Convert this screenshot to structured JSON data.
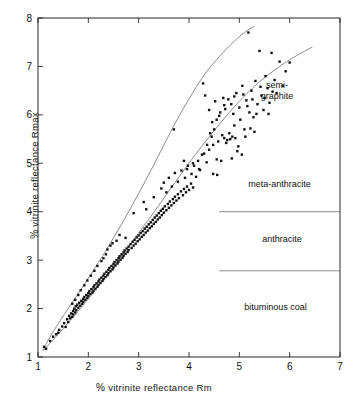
{
  "figure": {
    "background": "#ffffff",
    "ink": "#111111",
    "curve_color": "#6f6f6f"
  },
  "chart_data": {
    "type": "scatter",
    "title": "",
    "xlabel": "% vitrinite reflectance  Rm",
    "ylabel": "% vitrinite reflectance  Rmax",
    "xlim": [
      1,
      7
    ],
    "ylim": [
      1,
      8
    ],
    "xticks": [
      1,
      2,
      3,
      4,
      5,
      6,
      7
    ],
    "yticks": [
      1,
      2,
      3,
      4,
      5,
      6,
      7,
      8
    ],
    "xtick_labels": [
      "1",
      "2",
      "3",
      "4",
      "5",
      "6",
      "7"
    ],
    "ytick_labels": [
      "1",
      "2",
      "3",
      "4",
      "5",
      "6",
      "7",
      "8"
    ],
    "grid": false,
    "legend": false,
    "marker": "filled-square",
    "marker_size_px": 2.4,
    "marker_color": "#111111",
    "boundary_curves": [
      {
        "name": "upper-boundary",
        "points": [
          [
            1.1,
            1.15
          ],
          [
            1.3,
            1.52
          ],
          [
            1.6,
            2.0
          ],
          [
            1.9,
            2.47
          ],
          [
            2.2,
            2.95
          ],
          [
            2.5,
            3.46
          ],
          [
            2.8,
            4.0
          ],
          [
            3.1,
            4.57
          ],
          [
            3.4,
            5.17
          ],
          [
            3.7,
            5.78
          ],
          [
            4.0,
            6.33
          ],
          [
            4.3,
            6.82
          ],
          [
            4.6,
            7.2
          ],
          [
            4.9,
            7.52
          ],
          [
            5.1,
            7.7
          ],
          [
            5.3,
            7.83
          ]
        ]
      },
      {
        "name": "lower-boundary",
        "points": [
          [
            1.1,
            1.13
          ],
          [
            1.4,
            1.47
          ],
          [
            1.8,
            1.95
          ],
          [
            2.2,
            2.46
          ],
          [
            2.6,
            3.0
          ],
          [
            3.0,
            3.56
          ],
          [
            3.4,
            4.13
          ],
          [
            3.8,
            4.72
          ],
          [
            4.2,
            5.28
          ],
          [
            4.6,
            5.8
          ],
          [
            5.0,
            6.28
          ],
          [
            5.4,
            6.68
          ],
          [
            5.8,
            7.0
          ],
          [
            6.1,
            7.2
          ],
          [
            6.45,
            7.4
          ]
        ]
      }
    ],
    "zone_dividers": [
      {
        "name": "meta-anthracite-anthracite-divider",
        "y": 4.0,
        "x_from": 4.6,
        "x_to": 7.0
      },
      {
        "name": "anthracite-bituminous-divider",
        "y": 2.78,
        "x_from": 4.6,
        "x_to": 7.0
      }
    ],
    "zone_labels": [
      {
        "name": "semi-graphite",
        "lines": [
          "semi-",
          "graphite"
        ],
        "x": 5.75,
        "y": 6.55
      },
      {
        "name": "meta-anthracite",
        "lines": [
          "meta-anthracite"
        ],
        "x": 5.8,
        "y": 4.52
      },
      {
        "name": "anthracite",
        "lines": [
          "anthracite"
        ],
        "x": 5.85,
        "y": 3.38
      },
      {
        "name": "bituminous coal",
        "lines": [
          "bituminous coal"
        ],
        "x": 5.72,
        "y": 1.98
      }
    ],
    "points": [
      [
        1.12,
        1.21
      ],
      [
        1.16,
        1.17
      ],
      [
        1.24,
        1.33
      ],
      [
        1.3,
        1.42
      ],
      [
        1.36,
        1.47
      ],
      [
        1.42,
        1.56
      ],
      [
        1.4,
        1.5
      ],
      [
        1.48,
        1.63
      ],
      [
        1.52,
        1.7
      ],
      [
        1.55,
        1.62
      ],
      [
        1.58,
        1.78
      ],
      [
        1.6,
        1.72
      ],
      [
        1.62,
        1.85
      ],
      [
        1.64,
        1.8
      ],
      [
        1.66,
        1.9
      ],
      [
        1.68,
        1.83
      ],
      [
        1.7,
        1.95
      ],
      [
        1.7,
        1.88
      ],
      [
        1.72,
        2.0
      ],
      [
        1.74,
        1.92
      ],
      [
        1.75,
        2.05
      ],
      [
        1.76,
        1.97
      ],
      [
        1.78,
        2.08
      ],
      [
        1.8,
        2.02
      ],
      [
        1.82,
        2.12
      ],
      [
        1.84,
        2.06
      ],
      [
        1.86,
        2.16
      ],
      [
        1.88,
        2.1
      ],
      [
        1.9,
        2.2
      ],
      [
        1.9,
        2.14
      ],
      [
        1.92,
        2.24
      ],
      [
        1.94,
        2.18
      ],
      [
        1.96,
        2.28
      ],
      [
        1.98,
        2.22
      ],
      [
        2.0,
        2.32
      ],
      [
        2.0,
        2.26
      ],
      [
        2.02,
        2.36
      ],
      [
        2.04,
        2.3
      ],
      [
        2.06,
        2.4
      ],
      [
        2.08,
        2.33
      ],
      [
        2.1,
        2.44
      ],
      [
        2.1,
        2.37
      ],
      [
        2.12,
        2.48
      ],
      [
        2.14,
        2.41
      ],
      [
        2.16,
        2.52
      ],
      [
        2.18,
        2.45
      ],
      [
        2.2,
        2.56
      ],
      [
        2.2,
        2.49
      ],
      [
        2.22,
        2.6
      ],
      [
        2.24,
        2.53
      ],
      [
        2.26,
        2.64
      ],
      [
        2.28,
        2.57
      ],
      [
        2.3,
        2.68
      ],
      [
        2.3,
        2.61
      ],
      [
        2.32,
        2.72
      ],
      [
        2.34,
        2.65
      ],
      [
        2.36,
        2.76
      ],
      [
        2.38,
        2.69
      ],
      [
        2.4,
        2.8
      ],
      [
        2.4,
        2.73
      ],
      [
        2.42,
        2.84
      ],
      [
        2.44,
        2.77
      ],
      [
        2.46,
        2.88
      ],
      [
        2.48,
        2.81
      ],
      [
        2.5,
        2.92
      ],
      [
        2.5,
        2.85
      ],
      [
        2.52,
        2.96
      ],
      [
        2.54,
        2.89
      ],
      [
        2.56,
        3.0
      ],
      [
        2.58,
        2.93
      ],
      [
        2.6,
        3.04
      ],
      [
        2.6,
        2.97
      ],
      [
        2.62,
        3.08
      ],
      [
        2.64,
        3.01
      ],
      [
        2.66,
        3.12
      ],
      [
        2.68,
        3.05
      ],
      [
        2.7,
        3.16
      ],
      [
        2.7,
        3.09
      ],
      [
        2.72,
        3.2
      ],
      [
        2.74,
        3.13
      ],
      [
        2.76,
        3.24
      ],
      [
        2.78,
        3.17
      ],
      [
        2.8,
        3.28
      ],
      [
        2.8,
        3.21
      ],
      [
        2.84,
        3.33
      ],
      [
        2.86,
        3.25
      ],
      [
        2.88,
        3.38
      ],
      [
        2.9,
        3.3
      ],
      [
        2.92,
        3.42
      ],
      [
        2.94,
        3.34
      ],
      [
        2.96,
        3.47
      ],
      [
        2.98,
        3.39
      ],
      [
        3.0,
        3.51
      ],
      [
        3.02,
        3.43
      ],
      [
        3.04,
        3.56
      ],
      [
        3.06,
        3.48
      ],
      [
        3.08,
        3.6
      ],
      [
        3.1,
        3.52
      ],
      [
        3.12,
        3.65
      ],
      [
        3.14,
        3.57
      ],
      [
        3.16,
        3.69
      ],
      [
        3.18,
        3.61
      ],
      [
        3.2,
        3.74
      ],
      [
        3.22,
        3.66
      ],
      [
        3.24,
        3.78
      ],
      [
        3.26,
        3.7
      ],
      [
        3.28,
        3.83
      ],
      [
        3.3,
        3.75
      ],
      [
        3.32,
        3.88
      ],
      [
        3.34,
        3.79
      ],
      [
        3.36,
        3.92
      ],
      [
        3.38,
        3.84
      ],
      [
        3.4,
        3.97
      ],
      [
        3.42,
        3.88
      ],
      [
        3.44,
        4.02
      ],
      [
        3.46,
        3.93
      ],
      [
        3.48,
        4.06
      ],
      [
        3.5,
        3.98
      ],
      [
        3.52,
        4.11
      ],
      [
        3.55,
        4.03
      ],
      [
        3.58,
        4.16
      ],
      [
        3.6,
        4.08
      ],
      [
        3.62,
        4.21
      ],
      [
        3.65,
        4.13
      ],
      [
        3.68,
        4.26
      ],
      [
        3.7,
        4.18
      ],
      [
        3.72,
        4.31
      ],
      [
        3.75,
        4.23
      ],
      [
        3.78,
        4.36
      ],
      [
        3.8,
        4.28
      ],
      [
        3.84,
        4.42
      ],
      [
        3.88,
        4.34
      ],
      [
        3.9,
        4.47
      ],
      [
        3.94,
        4.4
      ],
      [
        3.96,
        4.52
      ],
      [
        4.0,
        4.45
      ],
      [
        4.04,
        4.58
      ],
      [
        4.08,
        4.5
      ],
      [
        2.38,
        3.22
      ],
      [
        2.44,
        3.3
      ],
      [
        2.56,
        3.4
      ],
      [
        2.62,
        3.52
      ],
      [
        2.48,
        3.35
      ],
      [
        2.74,
        3.46
      ],
      [
        2.3,
        3.04
      ],
      [
        2.35,
        3.12
      ],
      [
        2.26,
        2.98
      ],
      [
        2.18,
        2.88
      ],
      [
        2.12,
        2.78
      ],
      [
        2.05,
        2.68
      ],
      [
        1.98,
        2.58
      ],
      [
        1.92,
        2.48
      ],
      [
        1.85,
        2.38
      ],
      [
        1.8,
        2.28
      ],
      [
        1.74,
        2.18
      ],
      [
        1.68,
        2.1
      ],
      [
        2.9,
        3.97
      ],
      [
        3.1,
        4.2
      ],
      [
        3.15,
        4.05
      ],
      [
        3.3,
        4.3
      ],
      [
        3.45,
        4.48
      ],
      [
        3.5,
        4.6
      ],
      [
        3.55,
        4.4
      ],
      [
        3.6,
        4.7
      ],
      [
        3.66,
        4.52
      ],
      [
        3.72,
        4.8
      ],
      [
        3.78,
        4.62
      ],
      [
        3.85,
        4.85
      ],
      [
        3.92,
        4.7
      ],
      [
        3.96,
        4.88
      ],
      [
        4.05,
        4.78
      ],
      [
        4.1,
        4.95
      ],
      [
        4.18,
        5.05
      ],
      [
        4.22,
        4.86
      ],
      [
        4.3,
        5.2
      ],
      [
        4.35,
        5.02
      ],
      [
        4.4,
        5.28
      ],
      [
        3.7,
        5.7
      ],
      [
        4.32,
        6.4
      ],
      [
        4.28,
        6.65
      ],
      [
        4.45,
        5.55
      ],
      [
        4.5,
        5.7
      ],
      [
        4.55,
        5.9
      ],
      [
        4.58,
        5.45
      ],
      [
        4.62,
        6.05
      ],
      [
        4.66,
        5.58
      ],
      [
        4.7,
        6.2
      ],
      [
        4.74,
        5.42
      ],
      [
        4.78,
        6.32
      ],
      [
        4.8,
        5.62
      ],
      [
        4.85,
        5.1
      ],
      [
        4.88,
        6.02
      ],
      [
        4.9,
        5.78
      ],
      [
        4.94,
        6.45
      ],
      [
        4.96,
        5.25
      ],
      [
        5.0,
        6.15
      ],
      [
        5.02,
        5.9
      ],
      [
        5.06,
        6.6
      ],
      [
        5.1,
        5.7
      ],
      [
        5.14,
        6.3
      ],
      [
        5.18,
        7.7
      ],
      [
        5.2,
        6.05
      ],
      [
        5.24,
        6.5
      ],
      [
        5.28,
        5.95
      ],
      [
        5.32,
        6.7
      ],
      [
        5.36,
        6.22
      ],
      [
        5.4,
        7.32
      ],
      [
        5.44,
        6.4
      ],
      [
        5.48,
        6.1
      ],
      [
        5.52,
        6.8
      ],
      [
        5.56,
        6.55
      ],
      [
        5.6,
        6.25
      ],
      [
        5.64,
        7.28
      ],
      [
        5.7,
        6.72
      ],
      [
        5.74,
        6.45
      ],
      [
        5.8,
        7.1
      ],
      [
        5.86,
        6.6
      ],
      [
        5.92,
        6.9
      ],
      [
        6.0,
        7.08
      ],
      [
        4.48,
        4.78
      ],
      [
        4.55,
        5.08
      ],
      [
        4.7,
        5.52
      ],
      [
        4.76,
        5.48
      ],
      [
        4.82,
        5.5
      ],
      [
        4.86,
        5.55
      ],
      [
        4.92,
        5.52
      ],
      [
        4.98,
        5.35
      ],
      [
        5.05,
        5.18
      ],
      [
        4.4,
        6.1
      ],
      [
        4.46,
        5.85
      ],
      [
        4.52,
        6.28
      ],
      [
        4.6,
        5.98
      ],
      [
        4.68,
        6.35
      ],
      [
        4.72,
        6.12
      ],
      [
        4.84,
        6.22
      ],
      [
        4.9,
        6.38
      ],
      [
        5.08,
        6.42
      ],
      [
        5.16,
        6.18
      ],
      [
        5.26,
        6.32
      ],
      [
        5.34,
        6.02
      ],
      [
        5.42,
        6.58
      ],
      [
        5.5,
        6.35
      ],
      [
        5.58,
        6.02
      ],
      [
        5.66,
        6.48
      ],
      [
        4.36,
        5.38
      ],
      [
        4.42,
        5.62
      ],
      [
        4.26,
        5.18
      ],
      [
        4.2,
        4.88
      ],
      [
        4.14,
        4.72
      ],
      [
        4.08,
        5.0
      ],
      [
        3.98,
        4.95
      ],
      [
        3.9,
        5.05
      ],
      [
        4.64,
        5.05
      ],
      [
        4.56,
        4.76
      ],
      [
        4.48,
        5.38
      ],
      [
        5.12,
        5.55
      ],
      [
        5.22,
        5.72
      ],
      [
        5.3,
        5.65
      ]
    ]
  }
}
